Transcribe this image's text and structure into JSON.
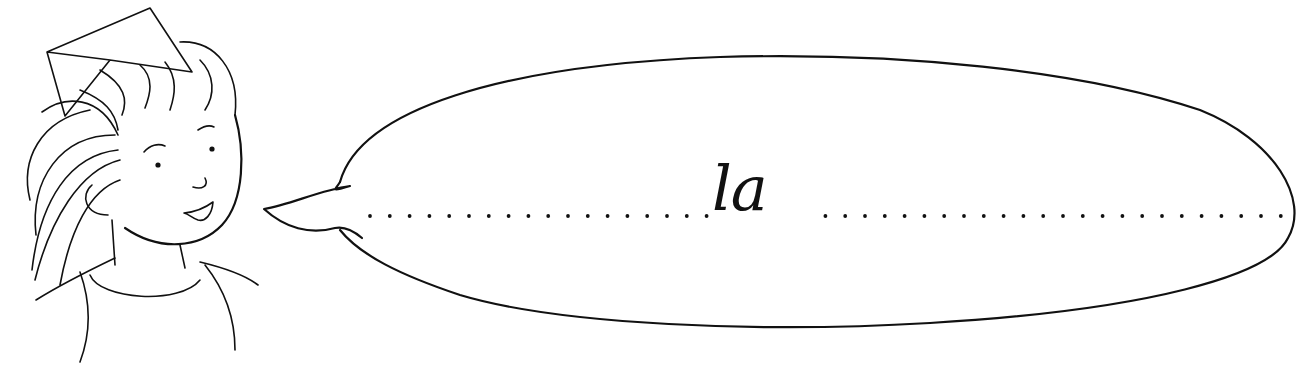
{
  "illustration": {
    "subject": "child with paper party hat speaking",
    "speech_bubble": {
      "word": "la",
      "guide_line": "dotted"
    },
    "colors": {
      "ink": "#111111",
      "background": "#ffffff"
    }
  }
}
